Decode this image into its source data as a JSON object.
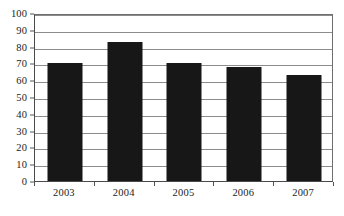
{
  "chart_data": {
    "type": "bar",
    "title": "",
    "subtitle": "",
    "xlabel": "",
    "ylabel": "",
    "categories": [
      "2003",
      "2004",
      "2005",
      "2006",
      "2007"
    ],
    "values": [
      70,
      83,
      70,
      68,
      63
    ],
    "series": [
      {
        "name": "",
        "values": [
          70,
          83,
          70,
          68,
          63
        ]
      }
    ],
    "ylim": [
      0,
      100
    ],
    "y_ticks": [
      0,
      10,
      20,
      30,
      40,
      50,
      60,
      70,
      80,
      90,
      100
    ],
    "y_tick_labels": [
      "0",
      "10",
      "20",
      "30",
      "40",
      "50",
      "60",
      "70",
      "80",
      "90",
      "100"
    ],
    "grid": true,
    "grid_axis": "y",
    "legend": false,
    "legend_position": "none",
    "annotations": [],
    "bar_color": "#171717",
    "grid_color": "#8c8c8c",
    "axis_color": "#4a4a4a",
    "background_color": "#ffffff",
    "text_color": "#1c1c1c"
  }
}
